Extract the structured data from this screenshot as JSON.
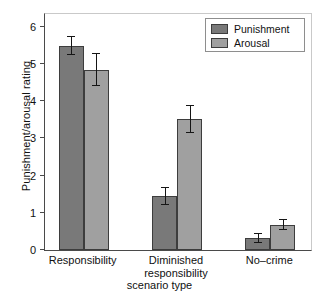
{
  "chart_data": {
    "type": "bar",
    "title": "",
    "xlabel": "scenario type",
    "ylabel": "Punishment/arousal rating",
    "ylim": [
      0,
      6.4
    ],
    "yticks": [
      0,
      1,
      2,
      3,
      4,
      5,
      6
    ],
    "ytick_labels": [
      "0",
      "1",
      "2",
      "3",
      "4",
      "5",
      "6"
    ],
    "grid": false,
    "legend_position": "top-right",
    "categories": [
      "Responsibility",
      "Diminished responsibility",
      "No-crime"
    ],
    "category_label_lines": [
      [
        "Responsibility"
      ],
      [
        "Diminished",
        "responsibility"
      ],
      [
        "No–crime"
      ]
    ],
    "series": [
      {
        "name": "Punishment",
        "color": "#797979",
        "values": [
          5.48,
          1.44,
          0.31
        ],
        "errors": [
          0.24,
          0.24,
          0.13
        ]
      },
      {
        "name": "Arousal",
        "color": "#a0a0a0",
        "values": [
          4.85,
          3.51,
          0.67
        ],
        "errors": [
          0.43,
          0.37,
          0.13
        ]
      }
    ]
  },
  "legend": {
    "items": [
      {
        "label": "Punishment",
        "color": "#797979"
      },
      {
        "label": "Arousal",
        "color": "#a0a0a0"
      }
    ]
  },
  "axes": {
    "y_title": "Punishment/arousal rating",
    "x_title": "scenario type"
  }
}
